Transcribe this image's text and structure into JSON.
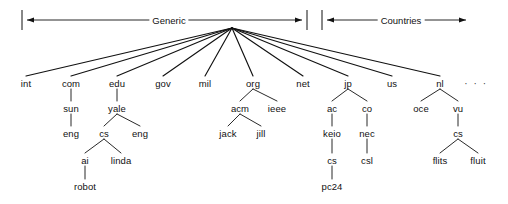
{
  "figure": {
    "background_color": "#ffffff",
    "line_color": "#111111",
    "text_color": "#111111"
  },
  "spans": [
    {
      "id": "generic",
      "label": "Generic",
      "label_x": 169,
      "label_y": 20,
      "bar_left_x": 22,
      "bar_right_x": 307,
      "y": 20,
      "arrow_left": true,
      "arrow_right": true,
      "tick_left": true,
      "tick_right": true
    },
    {
      "id": "countries",
      "label": "Countries",
      "label_x": 401,
      "label_y": 20,
      "bar_left_x": 322,
      "bar_right_x": 466,
      "y": 20,
      "arrow_left": true,
      "arrow_right": true,
      "tick_left": true,
      "tick_right": false
    }
  ],
  "root": {
    "x": 232,
    "y": 28
  },
  "ellipsis": {
    "text": "· · ·",
    "x": 476,
    "y": 83
  },
  "nodes": [
    {
      "id": "int",
      "label": "int",
      "x": 26,
      "y": 83,
      "parent": null
    },
    {
      "id": "com",
      "label": "com",
      "x": 71,
      "y": 83,
      "parent": null
    },
    {
      "id": "edu",
      "label": "edu",
      "x": 117,
      "y": 83,
      "parent": null
    },
    {
      "id": "gov",
      "label": "gov",
      "x": 163,
      "y": 83,
      "parent": null
    },
    {
      "id": "mil",
      "label": "mil",
      "x": 205,
      "y": 83,
      "parent": null
    },
    {
      "id": "org",
      "label": "org",
      "x": 253,
      "y": 83,
      "parent": null
    },
    {
      "id": "net",
      "label": "net",
      "x": 303,
      "y": 83,
      "parent": null
    },
    {
      "id": "jp",
      "label": "jp",
      "x": 348,
      "y": 83,
      "parent": null
    },
    {
      "id": "us",
      "label": "us",
      "x": 392,
      "y": 83,
      "parent": null
    },
    {
      "id": "nl",
      "label": "nl",
      "x": 440,
      "y": 83,
      "parent": null
    },
    {
      "id": "sun",
      "label": "sun",
      "x": 71,
      "y": 108,
      "parent": "com"
    },
    {
      "id": "yale",
      "label": "yale",
      "x": 117,
      "y": 108,
      "parent": "edu"
    },
    {
      "id": "acm",
      "label": "acm",
      "x": 240,
      "y": 108,
      "parent": "org"
    },
    {
      "id": "ieee",
      "label": "ieee",
      "x": 277,
      "y": 108,
      "parent": "org"
    },
    {
      "id": "ac",
      "label": "ac",
      "x": 332,
      "y": 108,
      "parent": "jp"
    },
    {
      "id": "co",
      "label": "co",
      "x": 367,
      "y": 108,
      "parent": "jp"
    },
    {
      "id": "oce",
      "label": "oce",
      "x": 421,
      "y": 108,
      "parent": "nl"
    },
    {
      "id": "vu",
      "label": "vu",
      "x": 458,
      "y": 108,
      "parent": "nl"
    },
    {
      "id": "eng1",
      "label": "eng",
      "x": 71,
      "y": 133,
      "parent": "sun"
    },
    {
      "id": "cs1",
      "label": "cs",
      "x": 104,
      "y": 133,
      "parent": "yale"
    },
    {
      "id": "eng2",
      "label": "eng",
      "x": 140,
      "y": 133,
      "parent": "yale"
    },
    {
      "id": "jack",
      "label": "jack",
      "x": 228,
      "y": 133,
      "parent": "acm"
    },
    {
      "id": "jill",
      "label": "jill",
      "x": 261,
      "y": 133,
      "parent": "acm"
    },
    {
      "id": "keio",
      "label": "keio",
      "x": 332,
      "y": 133,
      "parent": "ac"
    },
    {
      "id": "nec",
      "label": "nec",
      "x": 367,
      "y": 133,
      "parent": "co"
    },
    {
      "id": "cs3",
      "label": "cs",
      "x": 458,
      "y": 133,
      "parent": "vu"
    },
    {
      "id": "ai",
      "label": "ai",
      "x": 85,
      "y": 160,
      "parent": "cs1"
    },
    {
      "id": "linda",
      "label": "linda",
      "x": 121,
      "y": 160,
      "parent": "cs1"
    },
    {
      "id": "cs2",
      "label": "cs",
      "x": 332,
      "y": 160,
      "parent": "keio"
    },
    {
      "id": "csl",
      "label": "csl",
      "x": 367,
      "y": 160,
      "parent": "nec"
    },
    {
      "id": "flits",
      "label": "flits",
      "x": 440,
      "y": 160,
      "parent": "cs3"
    },
    {
      "id": "fluit",
      "label": "fluit",
      "x": 478,
      "y": 160,
      "parent": "cs3"
    },
    {
      "id": "robot",
      "label": "robot",
      "x": 85,
      "y": 186,
      "parent": "ai"
    },
    {
      "id": "pc24",
      "label": "pc24",
      "x": 332,
      "y": 186,
      "parent": "cs2"
    }
  ]
}
